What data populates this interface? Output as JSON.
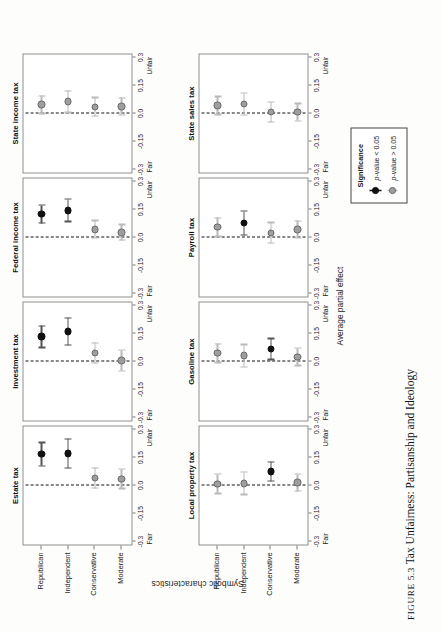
{
  "caption": {
    "figure_number": "FIGURE 5.3",
    "text": "Tax Unfairness: Partisanship and Ideology"
  },
  "axes": {
    "y_axis_title": "Symbolic characteristics",
    "x_axis_title": "Average partial effect",
    "categories": [
      "Republican",
      "Independent",
      "Conservative",
      "Moderate"
    ],
    "x_ticks": [
      "-0.3",
      "-0.15",
      "0.0",
      "0.15",
      "0.3"
    ],
    "x_left_end_label": "Fair",
    "x_right_end_label": "Unfair",
    "x_min": -0.3,
    "x_max": 0.3
  },
  "legend": {
    "title": "Significance",
    "items": [
      {
        "marker": "filled-black-circle",
        "label_prefix": "p",
        "label": "p-value < 0.05",
        "significant": true
      },
      {
        "marker": "gray-circle",
        "label_prefix": "p",
        "label": "p-value > 0.05",
        "significant": false
      }
    ]
  },
  "colors": {
    "significant": "#111111",
    "not_significant": "#9e9e9e",
    "not_significant_edge": "#6a6a6a",
    "whisker_significant": "#555555",
    "whisker_not_significant": "#b9b9b9",
    "panel_border": "#8f8f8f",
    "zero_line": "#111111"
  },
  "chart_data": {
    "type": "scatter",
    "title": "Tax Unfairness: Partisanship and Ideology",
    "xlabel": "Average partial effect",
    "ylabel": "Symbolic characteristics",
    "xlim": [
      -0.3,
      0.3
    ],
    "xticks": [
      -0.3,
      -0.15,
      0.0,
      0.15,
      0.3
    ],
    "xticklabels": [
      "-0.3",
      "-0.15",
      "0.0",
      "0.15",
      "0.3"
    ],
    "x_end_labels": [
      "Fair",
      "Unfair"
    ],
    "grid": false,
    "legend_position": "bottom-right",
    "reference_line": 0.0,
    "categories": [
      "Republican",
      "Independent",
      "Conservative",
      "Moderate"
    ],
    "panel_layout": {
      "rows": 2,
      "cols": 4
    },
    "panels": [
      {
        "title": "Estate tax",
        "row": 0,
        "col": 0,
        "points": [
          {
            "category": "Republican",
            "value": 0.163,
            "low": 0.1,
            "high": 0.225,
            "significant": true
          },
          {
            "category": "Independent",
            "value": 0.167,
            "low": 0.088,
            "high": 0.245,
            "significant": true
          },
          {
            "category": "Conservative",
            "value": 0.035,
            "low": -0.02,
            "high": 0.09,
            "significant": false
          },
          {
            "category": "Moderate",
            "value": 0.03,
            "low": -0.022,
            "high": 0.082,
            "significant": false
          }
        ]
      },
      {
        "title": "Investment tax",
        "row": 0,
        "col": 1,
        "points": [
          {
            "category": "Republican",
            "value": 0.128,
            "low": 0.07,
            "high": 0.186,
            "significant": true
          },
          {
            "category": "Independent",
            "value": 0.155,
            "low": 0.083,
            "high": 0.228,
            "significant": true
          },
          {
            "category": "Conservative",
            "value": 0.04,
            "low": -0.015,
            "high": 0.095,
            "significant": false
          },
          {
            "category": "Moderate",
            "value": 0.0,
            "low": -0.055,
            "high": 0.055,
            "significant": false
          }
        ]
      },
      {
        "title": "Federal income tax",
        "row": 0,
        "col": 2,
        "points": [
          {
            "category": "Republican",
            "value": 0.12,
            "low": 0.072,
            "high": 0.168,
            "significant": true
          },
          {
            "category": "Independent",
            "value": 0.14,
            "low": 0.08,
            "high": 0.2,
            "significant": true
          },
          {
            "category": "Conservative",
            "value": 0.038,
            "low": -0.008,
            "high": 0.085,
            "significant": false
          },
          {
            "category": "Moderate",
            "value": 0.022,
            "low": -0.02,
            "high": 0.064,
            "significant": false
          }
        ]
      },
      {
        "title": "State income tax",
        "row": 0,
        "col": 3,
        "points": [
          {
            "category": "Republican",
            "value": 0.042,
            "low": -0.005,
            "high": 0.09,
            "significant": false
          },
          {
            "category": "Independent",
            "value": 0.058,
            "low": 0.0,
            "high": 0.116,
            "significant": false
          },
          {
            "category": "Conservative",
            "value": 0.03,
            "low": -0.02,
            "high": 0.08,
            "significant": false
          },
          {
            "category": "Moderate",
            "value": 0.032,
            "low": -0.013,
            "high": 0.078,
            "significant": false
          }
        ]
      },
      {
        "title": "Local property tax",
        "row": 1,
        "col": 0,
        "points": [
          {
            "category": "Republican",
            "value": 0.004,
            "low": -0.048,
            "high": 0.056,
            "significant": false
          },
          {
            "category": "Independent",
            "value": 0.006,
            "low": -0.054,
            "high": 0.066,
            "significant": false
          },
          {
            "category": "Conservative",
            "value": 0.07,
            "low": 0.018,
            "high": 0.122,
            "significant": true
          },
          {
            "category": "Moderate",
            "value": 0.01,
            "low": -0.036,
            "high": 0.056,
            "significant": false
          }
        ]
      },
      {
        "title": "Gasoline tax",
        "row": 1,
        "col": 1,
        "points": [
          {
            "category": "Republican",
            "value": 0.04,
            "low": -0.01,
            "high": 0.09,
            "significant": false
          },
          {
            "category": "Independent",
            "value": 0.026,
            "low": -0.034,
            "high": 0.086,
            "significant": false
          },
          {
            "category": "Conservative",
            "value": 0.062,
            "low": 0.006,
            "high": 0.118,
            "significant": true
          },
          {
            "category": "Moderate",
            "value": 0.02,
            "low": -0.026,
            "high": 0.066,
            "significant": false
          }
        ]
      },
      {
        "title": "Payroll tax",
        "row": 1,
        "col": 2,
        "points": [
          {
            "category": "Republican",
            "value": 0.05,
            "low": 0.0,
            "high": 0.1,
            "significant": false
          },
          {
            "category": "Independent",
            "value": 0.072,
            "low": 0.008,
            "high": 0.136,
            "significant": true
          },
          {
            "category": "Conservative",
            "value": 0.02,
            "low": -0.035,
            "high": 0.075,
            "significant": false
          },
          {
            "category": "Moderate",
            "value": 0.038,
            "low": -0.008,
            "high": 0.084,
            "significant": false
          }
        ]
      },
      {
        "title": "State sales tax",
        "row": 1,
        "col": 3,
        "points": [
          {
            "category": "Republican",
            "value": 0.038,
            "low": -0.01,
            "high": 0.086,
            "significant": false
          },
          {
            "category": "Independent",
            "value": 0.046,
            "low": -0.012,
            "high": 0.104,
            "significant": false
          },
          {
            "category": "Conservative",
            "value": 0.002,
            "low": -0.052,
            "high": 0.056,
            "significant": false
          },
          {
            "category": "Moderate",
            "value": 0.002,
            "low": -0.044,
            "high": 0.048,
            "significant": false
          }
        ]
      }
    ]
  }
}
